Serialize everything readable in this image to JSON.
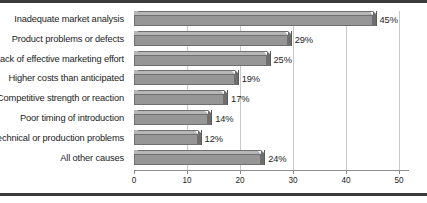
{
  "chart_data": {
    "type": "bar",
    "orientation": "horizontal",
    "title": "",
    "subtitle": "",
    "xlabel": "",
    "ylabel": "",
    "xlim": [
      0,
      50
    ],
    "xticks": [
      "0",
      "10",
      "20",
      "30",
      "40",
      "50"
    ],
    "grid": "vertical",
    "legend": "none",
    "style": "3d-extruded-bars",
    "colors": {
      "bar_front": "#969696",
      "bar_top": "#b6b6b6",
      "bar_side": "#6e6e6e",
      "bar_outline": "#6f6f6f",
      "gridline": "#c9c9c9",
      "axis": "#8d8d8d",
      "text": "#1c1c1c",
      "rule": "#3a3a3a",
      "background": "#ffffff"
    },
    "categories": [
      "Inadequate market analysis",
      "Product problems or defects",
      "Lack of effective marketing effort",
      "Higher costs than anticipated",
      "Competitive strength or reaction",
      "Poor timing of introduction",
      "Technical or production problems",
      "All other causes"
    ],
    "values": [
      45,
      29,
      25,
      19,
      17,
      14,
      12,
      24
    ],
    "value_labels": [
      "45%",
      "29%",
      "25%",
      "19%",
      "17%",
      "14%",
      "12%",
      "24%"
    ]
  }
}
